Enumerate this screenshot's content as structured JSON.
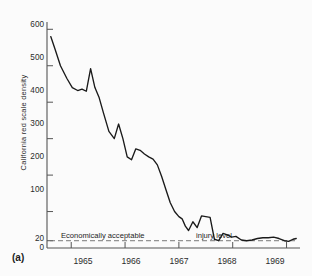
{
  "figure": {
    "panel_label": "(a)",
    "background_color": "#fbfbfb",
    "line_color": "#1a1a1a",
    "axis_color": "#555555"
  },
  "chart_data": {
    "type": "line",
    "title": "",
    "subtitle": "",
    "xlabel": "",
    "ylabel": "California  red  scale  density",
    "xlim": [
      1964.55,
      1969.25
    ],
    "ylim": [
      0,
      620
    ],
    "grid": false,
    "legend_position": "none",
    "y_ticks": [
      0,
      20,
      100,
      200,
      300,
      400,
      500,
      600
    ],
    "y_tick_labels": [
      "0",
      "20",
      "100",
      "200",
      "300",
      "400",
      "500",
      "600"
    ],
    "x_ticks": [
      1965,
      1966,
      1967,
      1968,
      1969
    ],
    "x_tick_labels": [
      "1965",
      "1966",
      "1967",
      "1968",
      "1969"
    ],
    "annotations": [
      {
        "text": "Economically acceptable",
        "x": 1965.05,
        "y": 38
      },
      {
        "text": "injury level",
        "x": 1967.25,
        "y": 38
      }
    ],
    "reference_lines": [
      {
        "value": 20,
        "style": "dashed",
        "orientation": "horizontal",
        "label": "Economically acceptable injury level"
      }
    ],
    "series": [
      {
        "name": "California red scale density",
        "x": [
          1964.62,
          1964.7,
          1964.8,
          1964.92,
          1965.02,
          1965.12,
          1965.2,
          1965.28,
          1965.36,
          1965.44,
          1965.52,
          1965.6,
          1965.7,
          1965.8,
          1965.88,
          1965.96,
          1966.04,
          1966.12,
          1966.2,
          1966.28,
          1966.36,
          1966.44,
          1966.52,
          1966.6,
          1966.68,
          1966.76,
          1966.84,
          1966.92,
          1967.0,
          1967.06,
          1967.12,
          1967.18,
          1967.26,
          1967.34,
          1967.42,
          1967.5,
          1967.58,
          1967.66,
          1967.74,
          1967.82,
          1967.9,
          1967.98,
          1968.06,
          1968.16,
          1968.26,
          1968.36,
          1968.46,
          1968.56,
          1968.66,
          1968.76,
          1968.86,
          1968.96,
          1969.04,
          1969.12,
          1969.18
        ],
        "values": [
          580,
          545,
          500,
          465,
          440,
          432,
          436,
          430,
          492,
          440,
          412,
          370,
          320,
          300,
          340,
          300,
          250,
          242,
          272,
          268,
          258,
          250,
          244,
          228,
          196,
          160,
          124,
          100,
          86,
          80,
          60,
          48,
          72,
          56,
          88,
          86,
          84,
          24,
          20,
          40,
          36,
          30,
          32,
          22,
          20,
          22,
          26,
          28,
          28,
          30,
          26,
          20,
          18,
          24,
          26
        ]
      }
    ]
  }
}
